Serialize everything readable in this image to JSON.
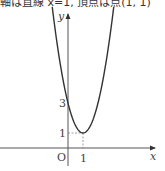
{
  "caption": "軸は直線 x=1, 頂点は点(1, 1)",
  "chart_data": {
    "type": "line",
    "title": "",
    "equation": "y = 2(x-1)^2 + 1",
    "xlabel": "x",
    "ylabel": "y",
    "origin_label": "O",
    "x_ticks": [
      "1"
    ],
    "y_ticks": [
      "1",
      "3"
    ],
    "vertex": [
      1,
      1
    ],
    "y_intercept": 3,
    "axis_of_symmetry": "x=1",
    "xlim": [
      -1.1,
      5.8
    ],
    "ylim": [
      -1.5,
      9.2
    ],
    "grid": false,
    "series": [
      {
        "name": "parabola",
        "x": [
          -1,
          0,
          1,
          2,
          3
        ],
        "values": [
          9,
          3,
          1,
          3,
          9
        ]
      }
    ],
    "guides": [
      {
        "type": "dashed",
        "from": [
          0,
          1
        ],
        "to": [
          1,
          1
        ]
      },
      {
        "type": "dashed",
        "from": [
          1,
          0
        ],
        "to": [
          1,
          1
        ]
      }
    ]
  },
  "labels": {
    "y_axis": "y",
    "x_axis": "x",
    "origin": "O",
    "tick_x1": "1",
    "tick_y1": "1",
    "tick_y3": "3"
  }
}
